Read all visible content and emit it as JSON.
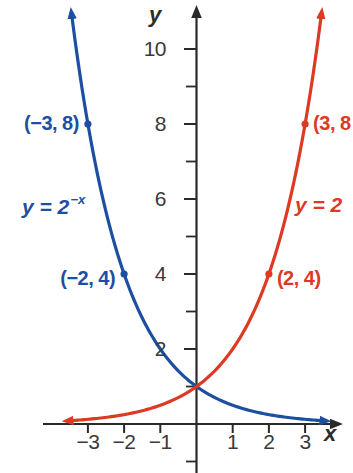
{
  "page": {
    "background": "#ffffff"
  },
  "chart_data": {
    "type": "line",
    "title": "",
    "xlabel": "x",
    "ylabel": "y",
    "xlim": [
      -4.2,
      4.3
    ],
    "ylim": [
      -1.3,
      11.5
    ],
    "grid": false,
    "axis_color": "#2a2a2a",
    "tick_label_color": "#3a3a3a",
    "x_ticks": [
      -3,
      -2,
      -1,
      1,
      2,
      3
    ],
    "x_tick_labels": [
      "−3",
      "−2",
      "−1",
      "1",
      "2",
      "3"
    ],
    "y_major_ticks": [
      2,
      4,
      6,
      8,
      10
    ],
    "y_major_tick_labels": [
      "2",
      "4",
      "6",
      "8",
      "10"
    ],
    "y_minor_ticks": [
      -1,
      1,
      3,
      5,
      7,
      9
    ],
    "series": [
      {
        "fn": "2^-x",
        "equation_base": "y = 2",
        "equation_sup": "−x",
        "color": "#1d4fa1",
        "x_range": [
          -3.44,
          3.45
        ],
        "labeled_points": [
          {
            "x": -3,
            "y": 8,
            "label": "(−3, 8)"
          },
          {
            "x": -2,
            "y": 4,
            "label": "(−2, 4)"
          }
        ]
      },
      {
        "fn": "2^x",
        "equation_visible": "y = 2",
        "color": "#dc3a23",
        "x_range": [
          -3.45,
          3.44
        ],
        "labeled_points": [
          {
            "x": 2,
            "y": 4,
            "label": "(2, 4)"
          },
          {
            "x": 3,
            "y": 8,
            "label": "(3, 8"
          }
        ]
      }
    ]
  }
}
